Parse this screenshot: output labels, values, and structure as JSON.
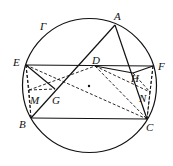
{
  "figure": {
    "circle": {
      "name": "Γ",
      "cx": 89.5,
      "cy": 85.5,
      "r": 67
    },
    "center_dot": {
      "x": 89,
      "y": 86
    },
    "points": {
      "A": {
        "x": 115,
        "y": 25,
        "lx": 114,
        "ly": 20
      },
      "B": {
        "x": 31,
        "y": 118,
        "lx": 19,
        "ly": 128
      },
      "C": {
        "x": 147,
        "y": 119,
        "lx": 146,
        "ly": 131
      },
      "D": {
        "x": 95,
        "y": 66,
        "lx": 92,
        "ly": 64
      },
      "E": {
        "x": 26,
        "y": 65,
        "lx": 13,
        "ly": 66
      },
      "F": {
        "x": 153,
        "y": 66,
        "lx": 158,
        "ly": 70
      },
      "G": {
        "x": 55,
        "y": 89,
        "lx": 52,
        "ly": 104
      },
      "H": {
        "x": 133,
        "y": 73,
        "lx": 131,
        "ly": 82
      },
      "M": {
        "x": 29,
        "y": 90,
        "lx": 30,
        "ly": 104
      },
      "N": {
        "x": 150,
        "y": 92,
        "lx": 139,
        "ly": 102
      }
    },
    "gamma_label": {
      "text": "Γ",
      "x": 40,
      "y": 30
    },
    "labels": [
      "A",
      "B",
      "C",
      "D",
      "E",
      "F",
      "G",
      "H",
      "M",
      "N"
    ],
    "solid_segments": [
      [
        "E",
        "F"
      ],
      [
        "B",
        "C"
      ],
      [
        "B",
        "A"
      ],
      [
        "A",
        "C"
      ],
      [
        "E",
        "G"
      ],
      [
        "D",
        "H"
      ],
      [
        "H",
        "F"
      ]
    ],
    "dashed_segments": [
      [
        "E",
        "B"
      ],
      [
        "E",
        "M"
      ],
      [
        "M",
        "B"
      ],
      [
        "M",
        "G"
      ],
      [
        "M",
        "D"
      ],
      [
        "E",
        "C"
      ],
      [
        "D",
        "C"
      ],
      [
        "D",
        "N"
      ],
      [
        "F",
        "N"
      ],
      [
        "N",
        "C"
      ],
      [
        "H",
        "N"
      ],
      [
        "F",
        "C"
      ]
    ]
  }
}
